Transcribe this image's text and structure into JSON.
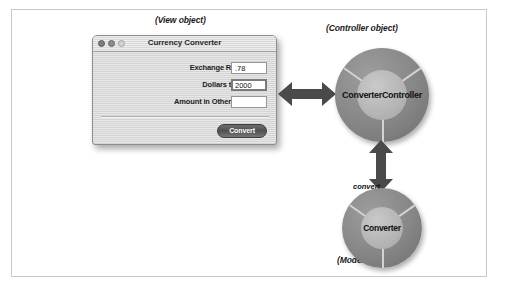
{
  "figure": {
    "captions": {
      "view": "(View object)",
      "controller": "(Controller object)",
      "model": "(Model object)"
    }
  },
  "window": {
    "title": "Currency Converter",
    "traffic_lights": [
      "close-button",
      "minimize-button",
      "zoom-button"
    ],
    "fields": [
      {
        "label": "Exchange Rate per $1:",
        "value": ".78",
        "focused": false
      },
      {
        "label": "Dollars to Convert:",
        "value": "2000",
        "focused": true
      },
      {
        "label": "Amount in Other Currency:",
        "value": "",
        "focused": false
      }
    ],
    "button": {
      "label": "Convert"
    }
  },
  "objects": {
    "controller": {
      "name": "ConverterController"
    },
    "model": {
      "name": "Converter",
      "method": "convert"
    }
  },
  "arrows": {
    "view_controller": "double-headed-horizontal-arrow",
    "controller_model": "double-headed-vertical-arrow"
  },
  "colors": {
    "frame_border": "#c9c9c9",
    "donut_ring": "#868686",
    "donut_hub": "#b5b5b5",
    "arrow": "#4a4a4a",
    "window_chrome": "#d9d9d9"
  }
}
